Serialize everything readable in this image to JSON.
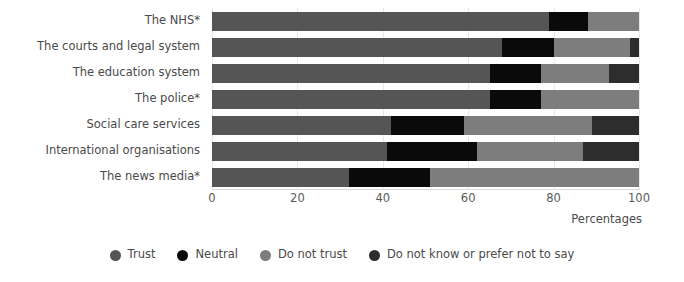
{
  "chart_data": {
    "type": "bar",
    "orientation": "horizontal",
    "stacked": true,
    "stack_mode": "percent",
    "title": "",
    "subtitle": "",
    "xlabel": "Percentages",
    "ylabel": "",
    "xlim": [
      0,
      100
    ],
    "xticks": [
      0,
      20,
      40,
      60,
      80,
      100
    ],
    "xtick_labels": [
      "0",
      "20",
      "40",
      "60",
      "80",
      "100"
    ],
    "grid": true,
    "grid_axis": "x",
    "legend_position": "bottom",
    "categories": [
      "The NHS*",
      "The courts and legal system",
      "The education system",
      "The police*",
      "Social care services",
      "International organisations",
      "The news media*"
    ],
    "series": [
      {
        "name": "Trust",
        "color": "#555555",
        "values": [
          79,
          68,
          65,
          65,
          42,
          41,
          32
        ]
      },
      {
        "name": "Neutral",
        "color": "#0a0a0a",
        "values": [
          9,
          12,
          12,
          12,
          17,
          21,
          19
        ]
      },
      {
        "name": "Do not trust",
        "color": "#7d7d7d",
        "values": [
          12,
          18,
          16,
          23,
          30,
          25,
          49
        ]
      },
      {
        "name": "Do not know or prefer not to say",
        "color": "#2d2d2d",
        "values": [
          0,
          2,
          7,
          0,
          11,
          13,
          0
        ]
      }
    ]
  },
  "legend": {
    "items": [
      {
        "label": "Trust",
        "color": "#555555"
      },
      {
        "label": "Neutral",
        "color": "#0a0a0a"
      },
      {
        "label": "Do not trust",
        "color": "#7d7d7d"
      },
      {
        "label": "Do not know or prefer not to say",
        "color": "#2d2d2d"
      }
    ]
  },
  "axis": {
    "x_title": "Percentages"
  },
  "colors": {
    "background": "#ffffff",
    "gridline": "#e8e8e8",
    "axis_line": "#d9d9d9",
    "label_text": "#4a4a4a",
    "tick_text": "#5a5a5a"
  }
}
